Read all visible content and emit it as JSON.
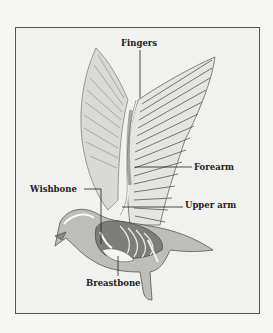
{
  "diagram": {
    "labels": [
      {
        "id": "fingers",
        "text": "Fingers"
      },
      {
        "id": "forearm",
        "text": "Forearm"
      },
      {
        "id": "wishbone",
        "text": "Wishbone"
      },
      {
        "id": "upper_arm",
        "text": "Upper arm"
      },
      {
        "id": "breastbone",
        "text": "Breastbone"
      }
    ],
    "colors": {
      "background": "#f6f6f5",
      "frame_border": "#555555",
      "ink": "#222222"
    }
  }
}
